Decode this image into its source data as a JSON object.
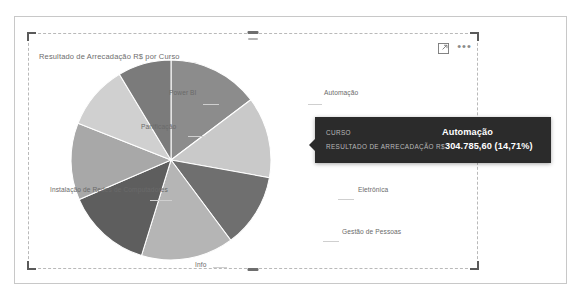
{
  "report": {
    "page_border_color": "#c8c8c8"
  },
  "visual": {
    "title": "Resultado de Arrecadação R$ por Curso",
    "header": {
      "focus_mode_icon": "focus-mode-icon",
      "more_options_label": "•••"
    },
    "selection": {
      "handle_color": "#5a5a5a"
    }
  },
  "tooltip": {
    "rows": [
      {
        "label": "CURSO",
        "value": "Automação"
      },
      {
        "label": "RESULTADO DE ARRECADAÇÃO R$",
        "value": "304.785,60 (14,71%)"
      }
    ],
    "background": "#2b2b2b"
  },
  "chart_data": {
    "type": "pie",
    "title": "Resultado de Arrecadação R$ por Curso",
    "xlabel": "",
    "ylabel": "",
    "value_label": "Resultado de Arrecadação R$",
    "category_label": "Curso",
    "legend_position": "none",
    "grid": false,
    "labels_shown": "category names with leader lines",
    "total": 2071955.0,
    "categories": [
      "Automação",
      "Eletrônica",
      "Gestão de Pessoas",
      "Info",
      "Instalação de Redes de Computadores",
      "Panificação",
      "Power BI"
    ],
    "slices": [
      {
        "name": "Automação",
        "value": 304785.6,
        "percent": 14.71,
        "color": "#8c8c8c"
      },
      {
        "name": "Eletrônica",
        "value": 272000.0,
        "percent": 13.13,
        "color": "#c9c9c9"
      },
      {
        "name": "Gestão de Pessoas",
        "value": 248000.0,
        "percent": 11.97,
        "color": "#6f6f6f"
      },
      {
        "name": "Info",
        "value": 310000.0,
        "percent": 14.96,
        "color": "#b5b5b5"
      },
      {
        "name": "Info (2)",
        "value": 285000.0,
        "percent": 13.76,
        "color": "#5e5e5e"
      },
      {
        "name": "Instalação de Redes de Computadores",
        "value": 258000.0,
        "percent": 12.45,
        "color": "#a8a8a8"
      },
      {
        "name": "Panificação",
        "value": 215169.4,
        "percent": 10.39,
        "color": "#d0d0d0"
      },
      {
        "name": "Power BI",
        "value": 179000.0,
        "percent": 8.63,
        "color": "#7b7b7b"
      }
    ],
    "data_labels": [
      {
        "text": "Power BI"
      },
      {
        "text": "Automação"
      },
      {
        "text": "Panificação"
      },
      {
        "text": "Eletrônica"
      },
      {
        "text": "Instalação de Redes de Computadores"
      },
      {
        "text": "Gestão de Pessoas"
      },
      {
        "text": "Info"
      }
    ]
  }
}
